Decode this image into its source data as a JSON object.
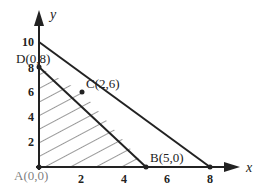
{
  "axes": {
    "x_label": "x",
    "y_label": "y",
    "x_ticks": [
      "2",
      "4",
      "6",
      "8"
    ],
    "y_ticks": [
      "2",
      "4",
      "6",
      "8",
      "10"
    ]
  },
  "points": {
    "A": "A(0,0)",
    "B": "B(5,0)",
    "C": "C(2,6)",
    "D": "D(0,8)"
  },
  "lines": [
    {
      "name": "line-10-8",
      "from": [
        0,
        10
      ],
      "to": [
        8,
        0
      ]
    },
    {
      "name": "line-D-B",
      "from": [
        0,
        8
      ],
      "to": [
        5,
        0
      ]
    }
  ],
  "feasible_region": {
    "vertices": [
      [
        0,
        0
      ],
      [
        5,
        0
      ],
      [
        2,
        6
      ],
      [
        0,
        8
      ]
    ],
    "fill": "hatched"
  },
  "colors": {
    "ink": "#222222",
    "background": "#ffffff"
  }
}
